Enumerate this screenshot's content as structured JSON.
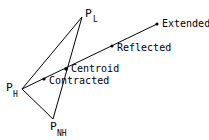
{
  "diagram": {
    "title": "",
    "vertices": {
      "p_h": {
        "label": "P",
        "sub": "H",
        "x": 22,
        "y": 89
      },
      "p_l": {
        "label": "P",
        "sub": "L",
        "x": 82,
        "y": 17
      },
      "p_nh": {
        "label": "P",
        "sub": "NH",
        "x": 53,
        "y": 119
      }
    },
    "points": {
      "contracted": {
        "label": "Contracted",
        "x": 44,
        "y": 79
      },
      "centroid": {
        "label": "Centroid",
        "x": 66,
        "y": 69
      },
      "reflected": {
        "label": "Reflected",
        "x": 112,
        "y": 46
      },
      "extended": {
        "label": "Extended",
        "x": 157,
        "y": 24
      }
    },
    "line_color": "#000000"
  }
}
